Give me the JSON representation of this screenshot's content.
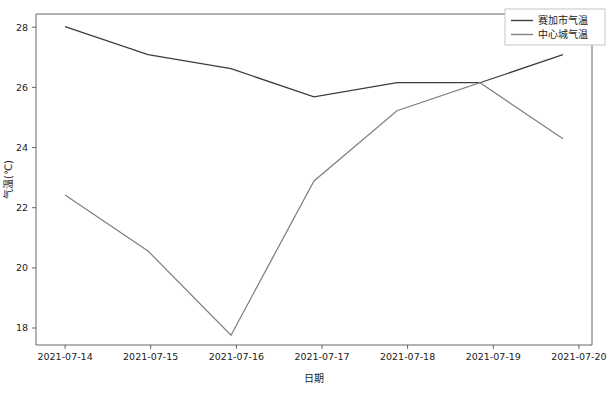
{
  "chart_data": {
    "type": "line",
    "title": "",
    "xlabel": "日期",
    "ylabel": "气温(℃)",
    "categories": [
      "2021-07-14",
      "2021-07-15",
      "2021-07-16",
      "2021-07-17",
      "2021-07-18",
      "2021-07-19",
      "2021-07-20"
    ],
    "series": [
      {
        "name": "赛加市气温",
        "color": "#3d3d3d",
        "values": [
          28.5,
          27.5,
          27.0,
          26.0,
          26.5,
          26.5,
          27.5
        ]
      },
      {
        "name": "中心城气温",
        "color": "#808080",
        "values": [
          22.5,
          20.5,
          17.5,
          23.0,
          25.5,
          26.5,
          24.5
        ]
      }
    ],
    "yticks": [
      18,
      20,
      22,
      24,
      26,
      28
    ],
    "ytick_labels": [
      "18",
      "20",
      "22",
      "24",
      "26",
      "28"
    ],
    "ylim": [
      17.15,
      28.95
    ],
    "xlim": [
      -0.35,
      6.35
    ],
    "grid": false,
    "legend_position": "upper right"
  },
  "axes": {
    "y_title": "气温(℃)",
    "x_title": "日期",
    "ytick_0": "18",
    "ytick_1": "20",
    "ytick_2": "22",
    "ytick_3": "24",
    "ytick_4": "26",
    "ytick_5": "28",
    "xtick_0": "2021-07-14",
    "xtick_1": "2021-07-15",
    "xtick_2": "2021-07-16",
    "xtick_3": "2021-07-17",
    "xtick_4": "2021-07-18",
    "xtick_5": "2021-07-19",
    "xtick_6": "2021-07-20"
  },
  "legend": {
    "entry_0": "赛加市气温",
    "entry_1": "中心城气温"
  }
}
